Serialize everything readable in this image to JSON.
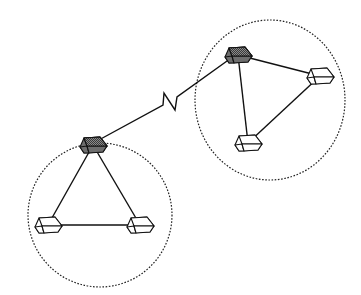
{
  "diagram": {
    "colors": {
      "background": "#ffffff",
      "line": "#111111",
      "hub_fill": "#6e6e6e",
      "hub_top": "#9a9a9a",
      "node_fill": "#ffffff"
    },
    "clusters": [
      {
        "id": "cluster-left",
        "boundary": {
          "cx": 100,
          "cy": 215,
          "rx": 72,
          "ry": 72,
          "style": "dotted"
        },
        "hub": {
          "id": "hub-left",
          "x": 93,
          "y": 143
        },
        "nodes": [
          {
            "id": "node-left-1",
            "x": 48,
            "y": 223
          },
          {
            "id": "node-left-2",
            "x": 140,
            "y": 223
          }
        ]
      },
      {
        "id": "cluster-right",
        "boundary": {
          "cx": 270,
          "cy": 100,
          "rx": 75,
          "ry": 80,
          "style": "dotted"
        },
        "hub": {
          "id": "hub-right",
          "x": 238,
          "y": 53
        },
        "nodes": [
          {
            "id": "node-right-1",
            "x": 320,
            "y": 74
          },
          {
            "id": "node-right-2",
            "x": 248,
            "y": 141
          }
        ]
      }
    ],
    "links": [
      {
        "from": "hub-left",
        "to": "node-left-1"
      },
      {
        "from": "hub-left",
        "to": "node-left-2"
      },
      {
        "from": "node-left-1",
        "to": "node-left-2"
      },
      {
        "from": "hub-right",
        "to": "node-right-1"
      },
      {
        "from": "hub-right",
        "to": "node-right-2"
      },
      {
        "from": "node-right-1",
        "to": "node-right-2"
      },
      {
        "from": "hub-left",
        "to": "hub-right",
        "type": "wireless-zigzag"
      }
    ]
  }
}
